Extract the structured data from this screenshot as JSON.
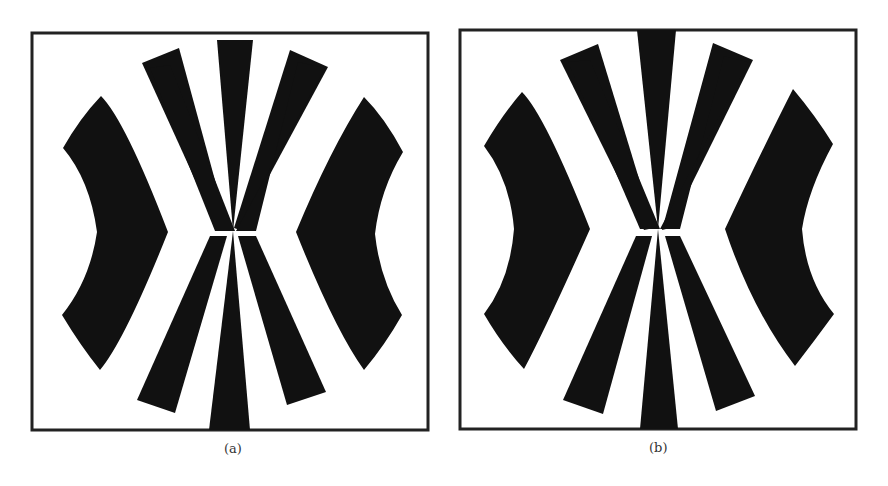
{
  "figure": {
    "panels": [
      {
        "id": "a",
        "caption": "(a)",
        "description": "Radial fan target pattern: central bowtie of wedges converging at center, two curved chevron shapes at left and right"
      },
      {
        "id": "b",
        "caption": "(b)",
        "description": "Same radial fan target pattern, slightly distorted variant, center wedges touch frame top and bottom"
      }
    ],
    "colors": {
      "foreground": "#111111",
      "background": "#ffffff",
      "frame": "#222222"
    }
  }
}
